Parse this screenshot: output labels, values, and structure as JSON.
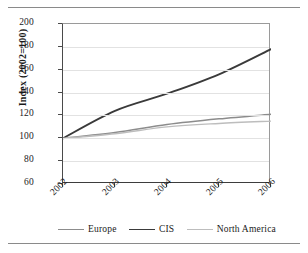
{
  "chart_data": {
    "type": "line",
    "title": "",
    "xlabel": "",
    "ylabel": "Index (2002=100)",
    "categories": [
      "2002",
      "2003",
      "2004",
      "2005",
      "2006"
    ],
    "x": [
      2002,
      2003,
      2004,
      2005,
      2006
    ],
    "ylim": [
      60,
      200
    ],
    "yticks": [
      60,
      80,
      100,
      120,
      140,
      160,
      200
    ],
    "ytick_labels": [
      "60",
      "80",
      "100",
      "120",
      "140",
      "160",
      "180",
      "200"
    ],
    "ytick_values": [
      60,
      80,
      100,
      120,
      140,
      160,
      180,
      200
    ],
    "grid": "horizontal",
    "legend_position": "bottom",
    "series": [
      {
        "name": "Europe",
        "color": "#8c8c8c",
        "width": 1.5,
        "values": [
          100,
          105,
          112,
          117,
          121
        ]
      },
      {
        "name": "CIS",
        "color": "#3a3a3a",
        "width": 1.9,
        "values": [
          100,
          124,
          139,
          156,
          178
        ]
      },
      {
        "name": "North America",
        "color": "#bdbdbd",
        "width": 1.4,
        "values": [
          100,
          104,
          110,
          113,
          115
        ]
      }
    ]
  },
  "legend": {
    "items": [
      {
        "label": "Europe"
      },
      {
        "label": "CIS"
      },
      {
        "label": "North America"
      }
    ]
  }
}
